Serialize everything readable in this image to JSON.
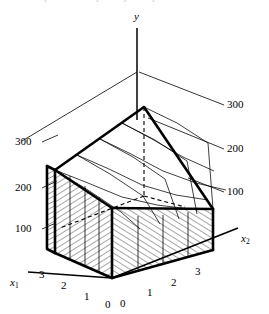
{
  "figure": {
    "kind": "3d-surface-mesh-plot",
    "background_color": "#ffffff",
    "ink_color": "#000000",
    "caption_remnant": "",
    "ghost_marks": [
      {
        "text": "p",
        "x": 44
      },
      {
        "text": "p",
        "x": 96
      },
      {
        "text": "j",
        "x": 124
      },
      {
        "text": "p",
        "x": 152
      }
    ]
  },
  "axes": {
    "vertical": {
      "name": "y",
      "label": "y",
      "label_x": 136,
      "label_y": 16,
      "tick_values": [
        100,
        200,
        300
      ]
    },
    "left_horizontal": {
      "name": "x1",
      "label": "x",
      "subscript": "1",
      "label_x": 12,
      "label_y": 283,
      "tick_labels": [
        "3",
        "2",
        "1",
        "0"
      ]
    },
    "right_horizontal": {
      "name": "x2",
      "label": "x",
      "subscript": "2",
      "label_x": 243,
      "label_y": 239,
      "tick_labels": [
        "0",
        "1",
        "2",
        "3"
      ]
    }
  },
  "value_labels": {
    "left_side": [
      {
        "text": "300",
        "x": 16,
        "y": 141,
        "leader_from": [
          44,
          146
        ],
        "leader_to": [
          74,
          132
        ]
      },
      {
        "text": "200",
        "x": 16,
        "y": 187,
        "leader_from": [
          44,
          192
        ],
        "leader_to": [
          66,
          181
        ]
      },
      {
        "text": "100",
        "x": 16,
        "y": 227,
        "leader_from": [
          44,
          232
        ],
        "leader_to": [
          64,
          223
        ]
      }
    ],
    "right_side": [
      {
        "text": "300",
        "x": 228,
        "y": 103,
        "leader_from": [
          225,
          108
        ],
        "leader_to": [
          150,
          74
        ]
      },
      {
        "text": "200",
        "x": 228,
        "y": 148,
        "leader_from": [
          225,
          153
        ],
        "leader_to": [
          152,
          122
        ]
      },
      {
        "text": "100",
        "x": 228,
        "y": 192,
        "leader_from": [
          225,
          197
        ],
        "leader_to": [
          187,
          180
        ]
      }
    ]
  },
  "tick_labels": {
    "x1_axis": [
      {
        "text": "3",
        "x": 41,
        "y": 276
      },
      {
        "text": "2",
        "x": 62,
        "y": 286
      },
      {
        "text": "1",
        "x": 86,
        "y": 297
      },
      {
        "text": "0",
        "x": 107,
        "y": 304
      }
    ],
    "x2_axis": [
      {
        "text": "0",
        "x": 121,
        "y": 303
      },
      {
        "text": "1",
        "x": 148,
        "y": 293
      },
      {
        "text": "2",
        "x": 172,
        "y": 283
      },
      {
        "text": "3",
        "x": 196,
        "y": 272
      }
    ]
  },
  "chart_data": {
    "type": "surface",
    "title": "",
    "xlabel": "x1",
    "ylabel": "y",
    "zlabel": "x2",
    "xlim": [
      0,
      3
    ],
    "zlim": [
      0,
      3
    ],
    "ylim": [
      0,
      300
    ],
    "grid": true,
    "legend": false,
    "x1_ticks": [
      0,
      1,
      2,
      3
    ],
    "x2_ticks": [
      0,
      1,
      2,
      3
    ],
    "y_ticks": [
      100,
      200,
      300
    ],
    "grid_values": [
      [
        300,
        230,
        180,
        165
      ],
      [
        230,
        150,
        100,
        95
      ],
      [
        180,
        100,
        40,
        55
      ],
      [
        165,
        95,
        55,
        90
      ]
    ]
  },
  "styles": {
    "surface_outline_width": 2.6,
    "mesh_line_width": 0.8,
    "axis_line_width": 1.4,
    "hatch_spacing": 4,
    "hatch_line_width": 0.7
  }
}
